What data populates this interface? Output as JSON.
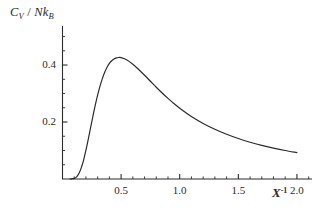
{
  "figure": {
    "background_color": "#ffffff",
    "line_color": "#2b2b2b",
    "axis_color": "#2b2b2b"
  },
  "axes": {
    "y_caption": {
      "numerator": "C",
      "numerator_sub": "V",
      "slash": " / ",
      "denominator": "Nk",
      "denominator_sub": "B"
    },
    "x_caption": {
      "symbol": "X",
      "exponent": "-1"
    }
  },
  "chart_data": {
    "type": "line",
    "title": "",
    "subtitle": "",
    "xlabel": "X^-1",
    "ylabel": "C_V / Nk_B",
    "xlim": [
      0,
      2.12
    ],
    "ylim": [
      0,
      0.53
    ],
    "xticks": [
      0.5,
      1.0,
      1.5,
      2.0
    ],
    "xticklabels": [
      "0.5",
      "1.0",
      "1.5",
      "2.0"
    ],
    "yticks": [
      0.2,
      0.4
    ],
    "yticklabels": [
      "0.2",
      "0.4"
    ],
    "x_minor_tick_step": 0.1,
    "y_minor_tick_step": 0.05,
    "grid": false,
    "legend": null,
    "series": [
      {
        "name": "Cv/NkB",
        "color": "#2b2b2b",
        "linewidth": 1.2,
        "x": [
          0.1,
          0.12,
          0.14,
          0.16,
          0.18,
          0.2,
          0.22,
          0.24,
          0.26,
          0.28,
          0.3,
          0.32,
          0.34,
          0.36,
          0.38,
          0.4,
          0.42,
          0.44,
          0.46,
          0.48,
          0.5,
          0.55,
          0.6,
          0.65,
          0.7,
          0.75,
          0.8,
          0.85,
          0.9,
          0.95,
          1.0,
          1.1,
          1.2,
          1.3,
          1.4,
          1.5,
          1.6,
          1.7,
          1.8,
          1.9,
          2.0
        ],
        "y": [
          0.002,
          0.0075,
          0.0195,
          0.039,
          0.0665,
          0.101,
          0.14,
          0.181,
          0.2215,
          0.26,
          0.295,
          0.326,
          0.3525,
          0.3745,
          0.392,
          0.4055,
          0.415,
          0.4215,
          0.425,
          0.4265,
          0.426,
          0.418,
          0.403,
          0.3845,
          0.364,
          0.343,
          0.322,
          0.302,
          0.283,
          0.265,
          0.2485,
          0.2195,
          0.195,
          0.1745,
          0.157,
          0.142,
          0.129,
          0.118,
          0.1085,
          0.1,
          0.0925
        ],
        "peak": {
          "x": 0.47,
          "y": 0.427
        }
      }
    ]
  }
}
